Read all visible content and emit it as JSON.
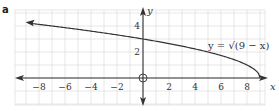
{
  "panel": {
    "label": "a"
  },
  "chart_data": {
    "type": "line",
    "title": "",
    "panel_label": "a",
    "xlabel": "x",
    "ylabel": "y",
    "equation_label": "y = √(9 − x)",
    "function": "sqrt(9 - x)",
    "xlim": [
      -9.8,
      9.4
    ],
    "ylim": [
      -2,
      5.2
    ],
    "grid": true,
    "x_ticks": [
      -8,
      -6,
      -4,
      -2,
      2,
      4,
      6,
      8
    ],
    "x_tick_labels": [
      "−8",
      "−6",
      "−4",
      "−2",
      "2",
      "4",
      "6",
      "8"
    ],
    "y_ticks": [
      2,
      4
    ],
    "y_tick_labels": [
      "2",
      "4"
    ],
    "origin_marker": "open-circle",
    "series": [
      {
        "name": "y = √(9 − x)",
        "x": [
          -8.8,
          -8,
          -6,
          -4,
          -2,
          0,
          2,
          4,
          6,
          8,
          9
        ],
        "values": [
          4.22,
          4.12,
          3.87,
          3.61,
          3.32,
          3.0,
          2.65,
          2.24,
          1.73,
          1.0,
          0.0
        ],
        "endpoint": [
          9,
          0
        ],
        "arrow_direction": "left"
      }
    ]
  }
}
